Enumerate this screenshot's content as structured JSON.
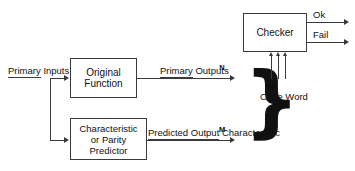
{
  "diagram": {
    "blocks": [
      {
        "id": "original-function",
        "lines": [
          "Original",
          "Function"
        ]
      },
      {
        "id": "parity-predictor",
        "lines": [
          "Characteristic",
          "or Parity",
          "Predictor"
        ]
      },
      {
        "id": "checker",
        "lines": [
          "Checker"
        ]
      }
    ],
    "labels": {
      "primary_inputs": [
        "Primary",
        "Inputs"
      ],
      "primary_outputs": [
        "Primary",
        "Outputs"
      ],
      "predicted_output": [
        "Predicted Output",
        "Characteristic"
      ],
      "code_word": [
        "Code",
        "Word"
      ],
      "bus_n": "N",
      "bus_m": "M",
      "checker_ok": "Ok",
      "checker_fail": "Fail",
      "brace": "}"
    },
    "colors": {
      "line": "#3a3a3a",
      "text": "#111111",
      "background": "#ffffff"
    }
  }
}
